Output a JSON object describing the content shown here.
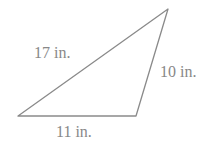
{
  "figure": {
    "type": "triangle",
    "stroke_color": "#8a8a8a",
    "text_color": "#888888",
    "vertices": [
      [
        18,
        116
      ],
      [
        136,
        116
      ],
      [
        168,
        9
      ]
    ],
    "sides": [
      {
        "id": "left",
        "label": "17 in."
      },
      {
        "id": "right",
        "label": "10 in."
      },
      {
        "id": "bottom",
        "label": "11 in."
      }
    ]
  }
}
